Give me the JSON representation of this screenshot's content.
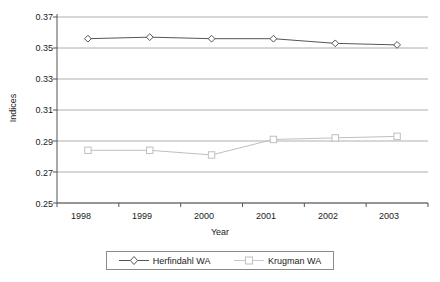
{
  "chart_data": {
    "type": "line",
    "title": "",
    "xlabel": "Year",
    "ylabel": "Indices",
    "categories": [
      "1998",
      "1999",
      "2000",
      "2001",
      "2002",
      "2003"
    ],
    "x": [
      1998,
      1999,
      2000,
      2001,
      2002,
      2003
    ],
    "ylim": [
      0.25,
      0.37
    ],
    "ytick_labels": [
      "0.37",
      "0.35",
      "0.33",
      "0.31",
      "0.29",
      "0.27",
      "0.25"
    ],
    "yticks": [
      0.37,
      0.35,
      0.33,
      0.31,
      0.29,
      0.27,
      0.25
    ],
    "grid": true,
    "legend_position": "bottom",
    "series": [
      {
        "name": "Herfindahl WA",
        "marker": "diamond",
        "color": "#555555",
        "values": [
          0.356,
          0.357,
          0.356,
          0.356,
          0.353,
          0.352
        ]
      },
      {
        "name": "Krugman WA",
        "marker": "square",
        "color": "#bfbfbf",
        "values": [
          0.284,
          0.284,
          0.281,
          0.291,
          0.292,
          0.293
        ]
      }
    ]
  },
  "colors": {
    "axis": "#555555",
    "grid": "#999999",
    "series_dark": "#555555",
    "series_light": "#bfbfbf",
    "background": "#ffffff"
  },
  "legend": {
    "items": [
      {
        "label": "Herfindahl WA",
        "marker": "diamond-marker-icon"
      },
      {
        "label": "Krugman WA",
        "marker": "square-marker-icon"
      }
    ]
  }
}
